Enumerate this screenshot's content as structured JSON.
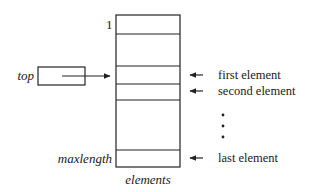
{
  "diagram": {
    "array": {
      "name": "elements",
      "index_first": "1",
      "index_last": "maxlength"
    },
    "pointer": {
      "name": "top"
    },
    "annotations": {
      "first": "first element",
      "second": "second element",
      "last": "last element",
      "ellipsis": "•"
    }
  }
}
